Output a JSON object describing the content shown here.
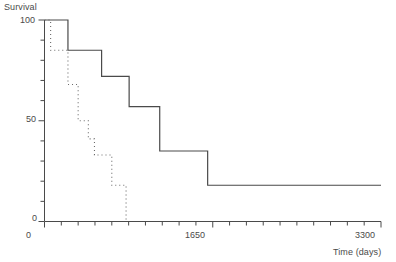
{
  "figure": {
    "background_color": "#ffffff",
    "line_color": "#4a4a4a"
  },
  "axes": {
    "ylabel": "Survival",
    "xlabel": "Time (days)",
    "y_tick_labels": [
      "100",
      "50",
      "0"
    ],
    "x_tick_labels": [
      "0",
      "1650",
      "3300"
    ]
  },
  "chart_data": {
    "type": "line",
    "title": "",
    "subtitle": "",
    "xlabel": "Time (days)",
    "ylabel": "Survival",
    "xlim": [
      0,
      3300
    ],
    "ylim": [
      0,
      100
    ],
    "grid": false,
    "legend_position": "none",
    "x_ticks_major": [
      0,
      1650,
      3300
    ],
    "x_ticks_minor_interval": 165,
    "y_ticks_major": [
      0,
      50,
      100
    ],
    "y_ticks_minor_interval": 10,
    "series": [
      {
        "name": "solid-curve",
        "style": "solid",
        "step": "post",
        "x": [
          0,
          230,
          560,
          830,
          1130,
          1600,
          3300
        ],
        "y": [
          100,
          85,
          72,
          57,
          35,
          18,
          18
        ]
      },
      {
        "name": "dotted-curve",
        "style": "dotted",
        "step": "post",
        "x": [
          0,
          60,
          230,
          330,
          430,
          490,
          660,
          800
        ],
        "y": [
          100,
          85,
          68,
          50,
          41,
          33,
          18,
          0
        ]
      }
    ]
  }
}
